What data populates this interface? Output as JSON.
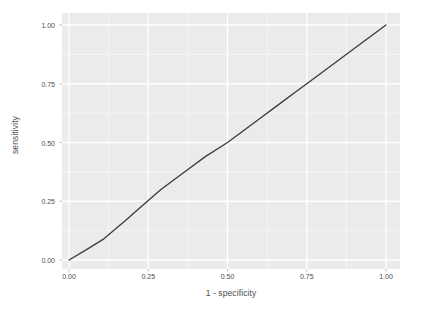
{
  "chart_data": {
    "type": "line",
    "title": "",
    "subtitle": "",
    "xlabel": "1 - specificity",
    "ylabel": "sensitivity",
    "xlim": [
      0.0,
      1.0
    ],
    "ylim": [
      0.0,
      1.0
    ],
    "grid": true,
    "legend": "none",
    "x_ticks": [
      0.0,
      0.25,
      0.5,
      0.75,
      1.0
    ],
    "x_tick_labels": [
      "0.00",
      "0.25",
      "0.50",
      "0.75",
      "1.00"
    ],
    "y_ticks": [
      0.0,
      0.25,
      0.5,
      0.75,
      1.0
    ],
    "y_tick_labels": [
      "0.00",
      "0.25",
      "0.50",
      "0.75",
      "1.00"
    ],
    "series": [
      {
        "name": "ROC curve",
        "color": "#3d3d3d",
        "x": [
          0.0,
          0.05,
          0.11,
          0.18,
          0.23,
          0.29,
          0.36,
          0.43,
          0.5,
          0.55,
          0.6,
          0.66,
          0.72,
          0.78,
          0.85,
          0.92,
          1.0
        ],
        "y": [
          0.0,
          0.04,
          0.09,
          0.17,
          0.23,
          0.3,
          0.37,
          0.44,
          0.5,
          0.55,
          0.6,
          0.66,
          0.72,
          0.78,
          0.85,
          0.92,
          1.0
        ]
      }
    ],
    "annotations": []
  },
  "style": {
    "panel_background": "#ebebeb",
    "plot_background": "#ffffff",
    "major_grid_color": "#ffffff",
    "minor_grid_color": "#f7f7f7",
    "axis_text_color": "#4d4d4d",
    "tick_mark_color": "#b3b3b3",
    "line_color": "#3d3d3d"
  },
  "axes": {
    "y_title": "sensitivity",
    "x_title": "1 - specificity"
  }
}
